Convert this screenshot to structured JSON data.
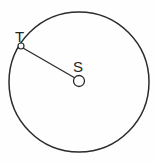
{
  "figure": {
    "type": "geometry-diagram",
    "background_color": "#fefefe",
    "stroke_color": "#2b2b2b",
    "label_color": "#262626"
  },
  "circle": {
    "name": "main-circle",
    "center_x": 79,
    "center_y": 82,
    "radius": 70,
    "stroke_width": 1.5,
    "fill": "none"
  },
  "points": [
    {
      "id": "S",
      "label": "S",
      "role": "center",
      "x": 79,
      "y": 81,
      "marker": "open-circle",
      "marker_radius": 5.5,
      "label_offset_x": -6,
      "label_offset_y": -22
    },
    {
      "id": "T",
      "label": "T",
      "role": "point-on-circle",
      "x": 21,
      "y": 46,
      "marker": "open-circle",
      "marker_radius": 3,
      "label_offset_x": -6,
      "label_offset_y": -17
    }
  ],
  "segments": [
    {
      "id": "TS",
      "name": "radius-segment",
      "from": "T",
      "to": "S",
      "x1": 23,
      "y1": 48,
      "x2": 75,
      "y2": 78,
      "stroke_width": 1.3
    }
  ],
  "labels": {
    "T": "T",
    "S": "S"
  }
}
